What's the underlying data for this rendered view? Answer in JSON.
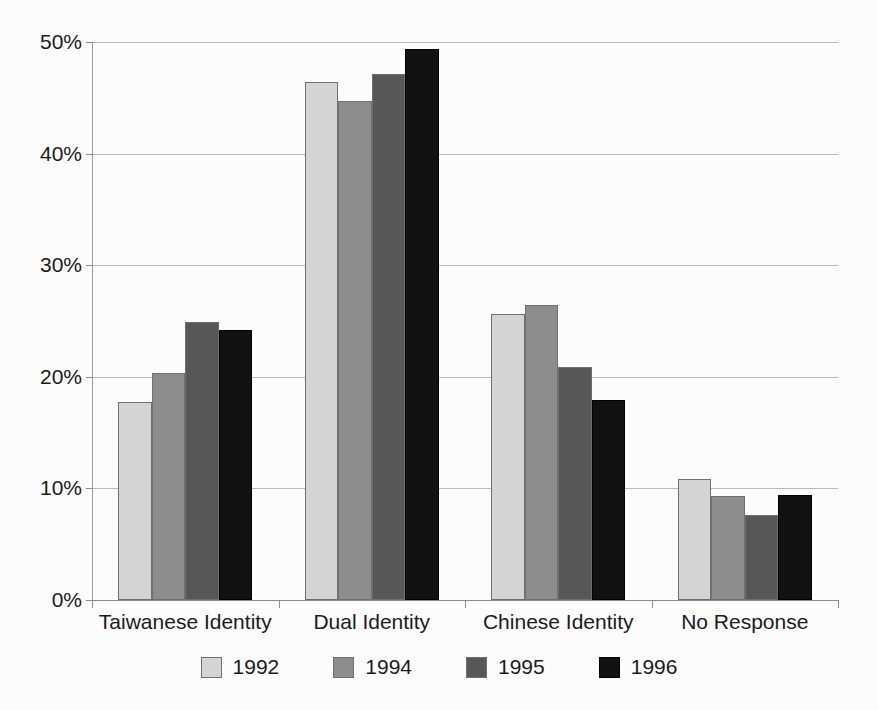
{
  "chart_data": {
    "type": "bar",
    "title": "",
    "subtitle": "",
    "xlabel": "",
    "ylabel": "",
    "categories": [
      "Taiwanese Identity",
      "Dual Identity",
      "Chinese Identity",
      "No Response"
    ],
    "series": [
      {
        "name": "1992",
        "color": "#d4d4d4",
        "values": [
          17.7,
          46.4,
          25.6,
          10.8
        ]
      },
      {
        "name": "1994",
        "color": "#8d8d8d",
        "values": [
          20.3,
          44.7,
          26.4,
          9.3
        ]
      },
      {
        "name": "1995",
        "color": "#575757",
        "values": [
          24.9,
          47.1,
          20.9,
          7.6
        ]
      },
      {
        "name": "1996",
        "color": "#121212",
        "values": [
          24.2,
          49.4,
          17.9,
          9.4
        ]
      }
    ],
    "ylim": [
      0,
      50
    ],
    "y_ticks": [
      0,
      10,
      20,
      30,
      40,
      50
    ],
    "y_tick_labels": [
      "0%",
      "10%",
      "20%",
      "30%",
      "40%",
      "50%"
    ],
    "grid": true,
    "legend_position": "bottom",
    "value_format": "percent"
  },
  "legend": {
    "entries": [
      {
        "label": "1992"
      },
      {
        "label": "1994"
      },
      {
        "label": "1995"
      },
      {
        "label": "1996"
      }
    ]
  }
}
